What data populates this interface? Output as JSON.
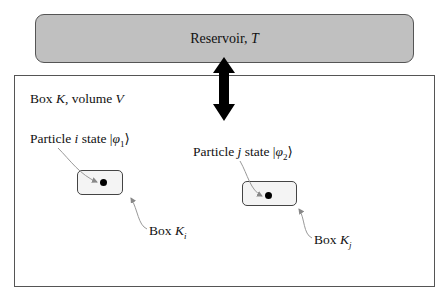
{
  "reservoir": {
    "label_prefix": "Reservoir, ",
    "label_var": "T",
    "fill_color": "#c0c0c0"
  },
  "outer_box": {
    "label_prefix": "Box ",
    "label_var": "K",
    "label_mid": ", volume ",
    "label_var2": "V"
  },
  "particles": [
    {
      "label_prefix": "Particle ",
      "label_var": "i",
      "label_mid": " state |",
      "label_state": "φ",
      "label_sub": "1",
      "label_suffix": "⟩",
      "box_label_prefix": "Box ",
      "box_label_var": "K",
      "box_label_sub": "i"
    },
    {
      "label_prefix": "Particle ",
      "label_var": "j",
      "label_mid": " state |",
      "label_state": "φ",
      "label_sub": "2",
      "label_suffix": "⟩",
      "box_label_prefix": "Box ",
      "box_label_var": "K",
      "box_label_sub": "j"
    }
  ],
  "arrow": {
    "type": "double-headed",
    "direction": "vertical",
    "color": "#000000"
  }
}
